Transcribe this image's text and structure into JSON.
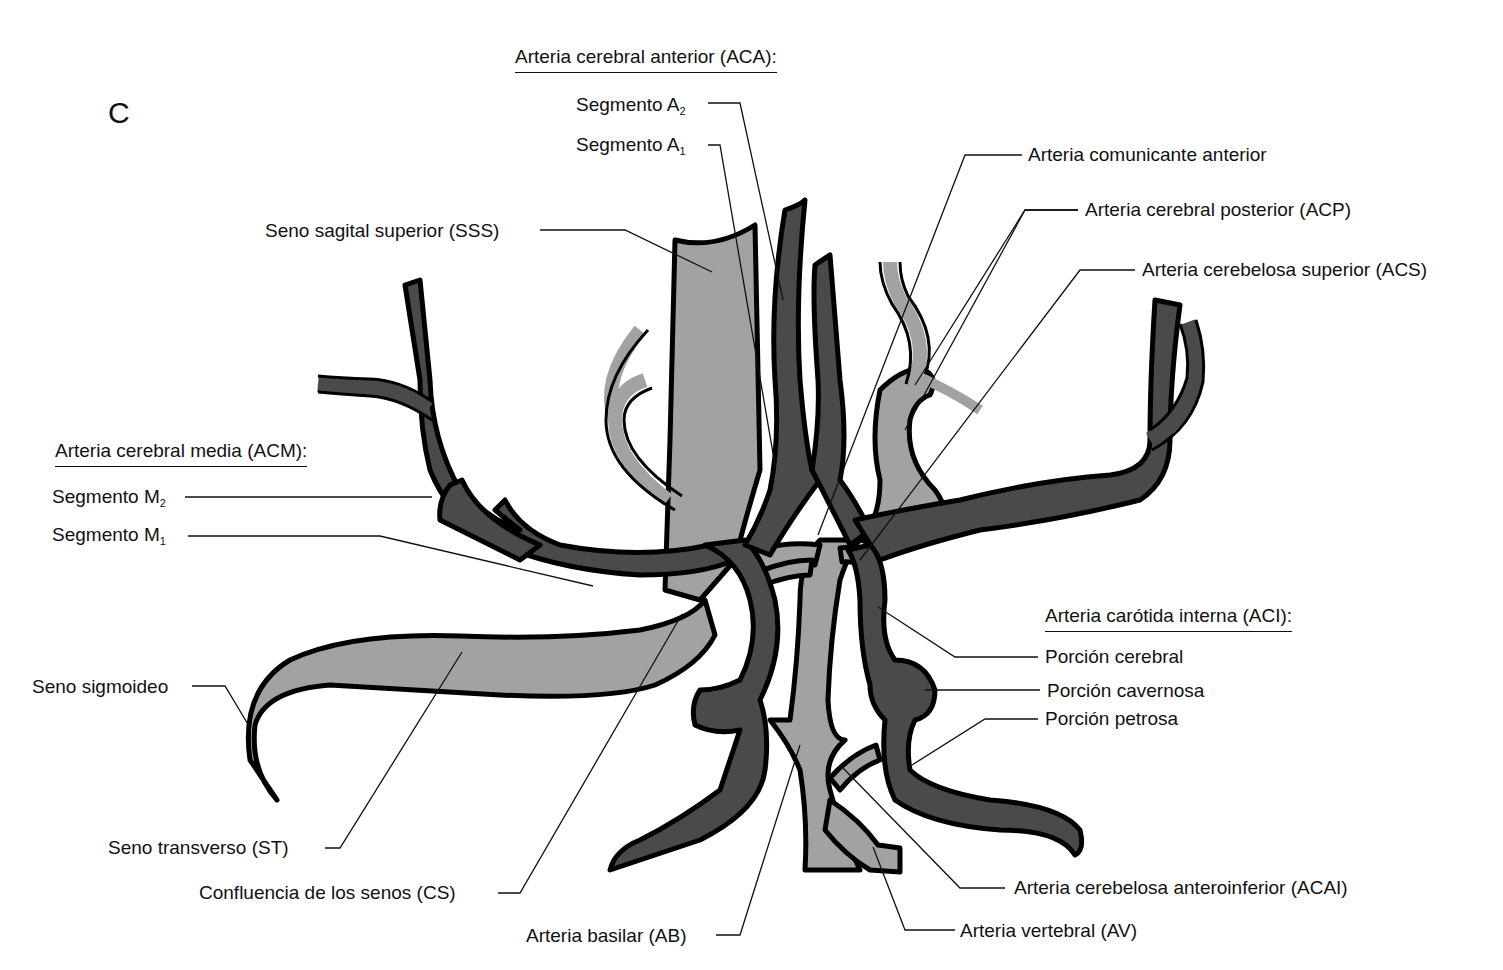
{
  "figure": {
    "panel_letter": "C",
    "colors": {
      "artery_fill": "#4a4a4a",
      "sinus_fill": "#a2a2a2",
      "outline": "#000000",
      "background": "#ffffff"
    }
  },
  "groups": {
    "aca": {
      "header": "Arteria cerebral anterior (ACA):",
      "items": [
        {
          "base": "Segmento A",
          "sub": "2"
        },
        {
          "base": "Segmento A",
          "sub": "1"
        }
      ]
    },
    "acm": {
      "header": "Arteria cerebral media (ACM):",
      "items": [
        {
          "base": "Segmento M",
          "sub": "2"
        },
        {
          "base": "Segmento M",
          "sub": "1"
        }
      ]
    },
    "aci": {
      "header": "Arteria carótida interna (ACI):",
      "items": [
        "Porción cerebral",
        "Porción cavernosa",
        "Porción petrosa"
      ]
    }
  },
  "labels": {
    "acoa": "Arteria comunicante anterior",
    "acp": "Arteria cerebral posterior (ACP)",
    "acs": "Arteria cerebelosa superior (ACS)",
    "sss": "Seno sagital superior (SSS)",
    "sigmoid": "Seno sigmoideo",
    "st": "Seno transverso (ST)",
    "cs": "Confluencia de los senos (CS)",
    "ab": "Arteria basilar (AB)",
    "acai": "Arteria cerebelosa anteroinferior (ACAI)",
    "av": "Arteria vertebral (AV)"
  }
}
